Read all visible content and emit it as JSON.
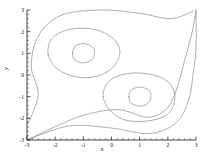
{
  "figure": {
    "xlabel": "x",
    "ylabel": "y",
    "caption": "",
    "line_color": "#7a7a7a",
    "axis_color": "#111111",
    "background": "#ffffff"
  },
  "chart_data": {
    "type": "line",
    "title": "",
    "subtitle": "",
    "xlabel": "x",
    "ylabel": "y",
    "xlim": [
      -3,
      3
    ],
    "ylim": [
      -3,
      3
    ],
    "xticks": [
      -3,
      -2,
      -1,
      0,
      1,
      2,
      3
    ],
    "yticks": [
      -3,
      -2,
      -1,
      0,
      1,
      2,
      3
    ],
    "xticklabels": [
      "-3",
      "-2",
      "-1",
      "0",
      "1",
      "2",
      "3"
    ],
    "yticklabels": [
      "-3",
      "-2",
      "-1",
      "0",
      "1",
      "2",
      "3"
    ],
    "minor_ticks": true,
    "grid": false,
    "legend": null,
    "plot_style": "contour",
    "critical_points": [
      {
        "name": "center-upper-left",
        "x": -1,
        "y": 1,
        "kind": "center"
      },
      {
        "name": "center-lower-right",
        "x": 1,
        "y": -1,
        "kind": "center"
      },
      {
        "name": "saddle-origin",
        "x": 0,
        "y": 0,
        "kind": "saddle"
      }
    ],
    "contours": [
      {
        "name": "inner-ring-upper-left",
        "closed": true,
        "center": [
          -1,
          1
        ],
        "points": [
          [
            -1.38,
            1.0
          ],
          [
            -1.3,
            1.32
          ],
          [
            -1.0,
            1.45
          ],
          [
            -0.68,
            1.3
          ],
          [
            -0.6,
            1.0
          ],
          [
            -0.7,
            0.7
          ],
          [
            -1.0,
            0.56
          ],
          [
            -1.3,
            0.7
          ]
        ]
      },
      {
        "name": "mid-ring-upper-left",
        "closed": true,
        "center": [
          -1,
          0.95
        ],
        "points": [
          [
            -2.25,
            0.95
          ],
          [
            -2.1,
            1.7
          ],
          [
            -1.45,
            2.12
          ],
          [
            -0.6,
            2.1
          ],
          [
            0.05,
            1.7
          ],
          [
            0.3,
            1.05
          ],
          [
            0.05,
            0.35
          ],
          [
            -0.5,
            -0.05
          ],
          [
            -1.2,
            -0.1
          ],
          [
            -1.9,
            0.25
          ]
        ]
      },
      {
        "name": "inner-ring-lower-right",
        "closed": true,
        "center": [
          1,
          -1
        ],
        "points": [
          [
            0.62,
            -1.0
          ],
          [
            0.7,
            -0.7
          ],
          [
            1.0,
            -0.56
          ],
          [
            1.32,
            -0.7
          ],
          [
            1.4,
            -1.0
          ],
          [
            1.3,
            -1.3
          ],
          [
            1.0,
            -1.44
          ],
          [
            0.7,
            -1.3
          ]
        ]
      },
      {
        "name": "mid-ring-lower-right",
        "closed": true,
        "center": [
          0.95,
          -1
        ],
        "points": [
          [
            -0.3,
            -1.0
          ],
          [
            -0.1,
            -0.3
          ],
          [
            0.5,
            0.05
          ],
          [
            1.3,
            0.05
          ],
          [
            2.0,
            -0.3
          ],
          [
            2.25,
            -1.0
          ],
          [
            2.05,
            -1.75
          ],
          [
            1.4,
            -2.1
          ],
          [
            0.55,
            -2.1
          ],
          [
            0.0,
            -1.7
          ]
        ]
      },
      {
        "name": "separatrix-outer",
        "closed": false,
        "points": [
          [
            -3,
            -3
          ],
          [
            -1.5,
            -2.35
          ],
          [
            0.0,
            -2.45
          ],
          [
            1.35,
            -2.7
          ],
          [
            2.3,
            -2.2
          ],
          [
            2.75,
            -1.1
          ],
          [
            2.9,
            0.1
          ],
          [
            3,
            1.2
          ],
          [
            3,
            3
          ]
        ]
      },
      {
        "name": "separatrix-inner",
        "closed": false,
        "points": [
          [
            -3,
            -3
          ],
          [
            -1.2,
            -1.95
          ],
          [
            0.2,
            -1.6
          ],
          [
            1.3,
            -1.95
          ],
          [
            2.0,
            -1.5
          ],
          [
            2.35,
            -0.5
          ],
          [
            2.6,
            0.7
          ],
          [
            2.85,
            1.9
          ],
          [
            3,
            3
          ]
        ]
      },
      {
        "name": "outer-envelope",
        "closed": false,
        "points": [
          [
            -2.95,
            -2.2
          ],
          [
            -2.6,
            -0.9
          ],
          [
            -2.85,
            0.4
          ],
          [
            -2.6,
            1.8
          ],
          [
            -1.8,
            2.75
          ],
          [
            -0.4,
            3.0
          ],
          [
            1.0,
            2.85
          ],
          [
            2.1,
            2.6
          ],
          [
            2.9,
            2.95
          ]
        ]
      }
    ]
  },
  "ticks": {
    "x": [
      {
        "value": -3,
        "label": "-3"
      },
      {
        "value": -2,
        "label": "-2"
      },
      {
        "value": -1,
        "label": "-1"
      },
      {
        "value": 0,
        "label": "0"
      },
      {
        "value": 1,
        "label": "1"
      },
      {
        "value": 2,
        "label": "2"
      },
      {
        "value": 3,
        "label": "3"
      }
    ],
    "y": [
      {
        "value": -3,
        "label": "-3"
      },
      {
        "value": -2,
        "label": "-2"
      },
      {
        "value": -1,
        "label": "-1"
      },
      {
        "value": 0,
        "label": "0"
      },
      {
        "value": 1,
        "label": "1"
      },
      {
        "value": 2,
        "label": "2"
      },
      {
        "value": 3,
        "label": "3"
      }
    ]
  }
}
